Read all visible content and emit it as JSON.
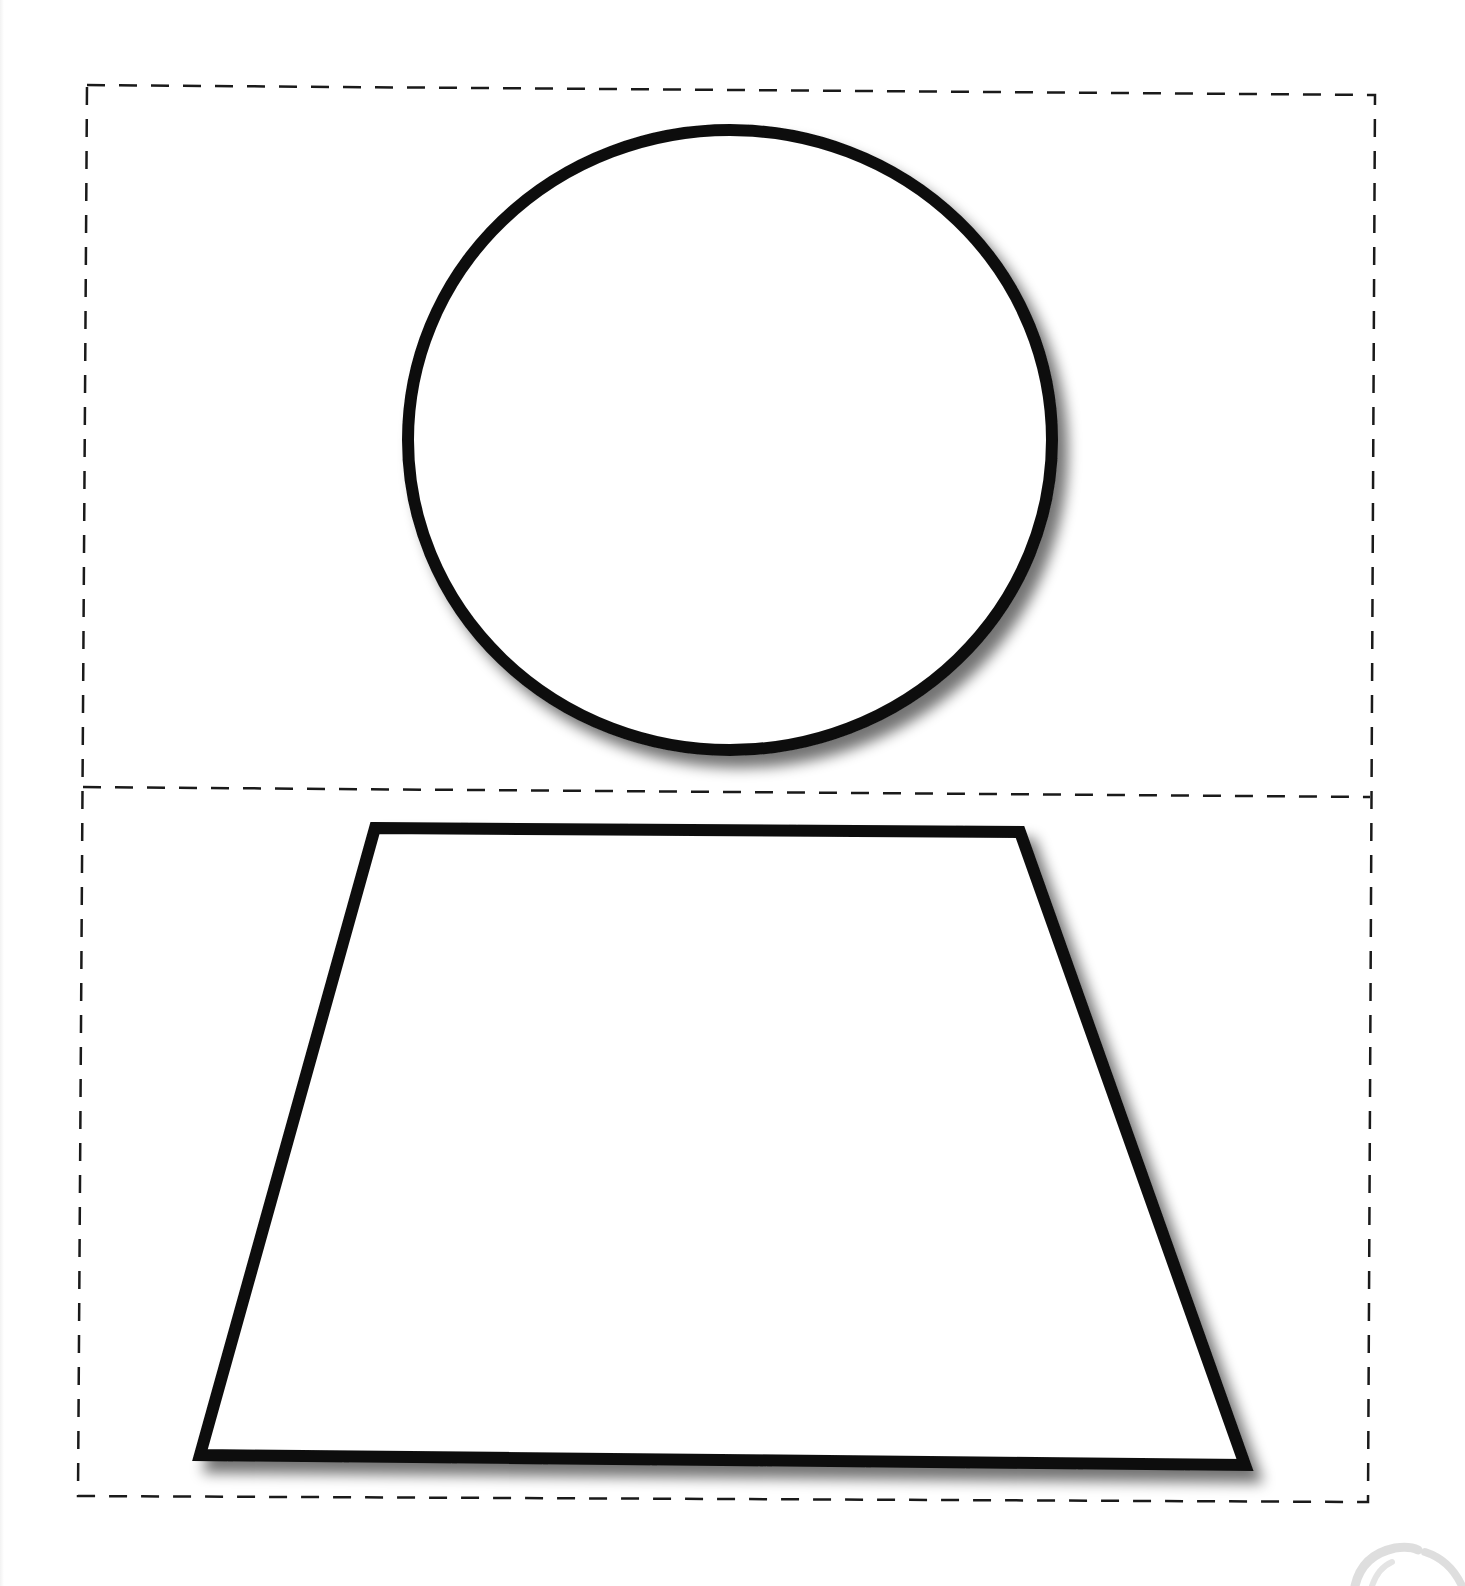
{
  "diagram": {
    "type": "cut-out template",
    "colors": {
      "background": "#ffffff",
      "outline": "#111111",
      "dash": "#1a1a1a",
      "shadow": "#7a7a7a",
      "watermark": "#d4d4d4"
    },
    "outer_frame": {
      "style": "dashed",
      "points": [
        [
          87,
          85
        ],
        [
          1375,
          95
        ],
        [
          1368,
          1502
        ],
        [
          78,
          1496
        ]
      ]
    },
    "divider": {
      "style": "dashed",
      "from": [
        83,
        787
      ],
      "to": [
        1370,
        797
      ]
    },
    "panels": [
      {
        "id": "top-panel",
        "shape": {
          "kind": "circle",
          "cx": 730,
          "cy": 440,
          "rx": 322,
          "ry": 310,
          "stroke_width": 12,
          "fill": "#ffffff",
          "shadow": true
        }
      },
      {
        "id": "bottom-panel",
        "shape": {
          "kind": "trapezoid",
          "points": [
            [
              375,
              828
            ],
            [
              1020,
              832
            ],
            [
              1245,
              1465
            ],
            [
              200,
              1455
            ]
          ],
          "stroke_width": 12,
          "fill": "#ffffff",
          "shadow": true
        }
      }
    ],
    "watermark": {
      "kind": "partial-arc-logo",
      "position": "bottom-right"
    }
  }
}
